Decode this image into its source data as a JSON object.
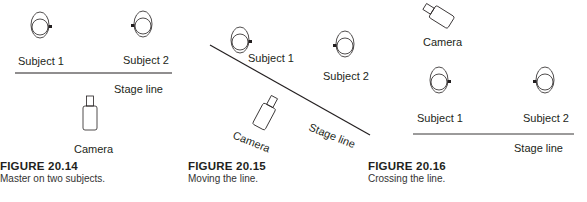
{
  "figures": [
    {
      "number": "FIGURE 20.14",
      "description": "Master on two subjects.",
      "labels": {
        "subject1": "Subject 1",
        "subject2": "Subject 2",
        "stage_line": "Stage line",
        "camera": "Camera"
      }
    },
    {
      "number": "FIGURE 20.15",
      "description": "Moving the line.",
      "labels": {
        "subject1": "Subject 1",
        "subject2": "Subject 2",
        "stage_line": "Stage line",
        "camera": "Camera"
      }
    },
    {
      "number": "FIGURE 20.16",
      "description": "Crossing the line.",
      "labels": {
        "subject1": "Subject 1",
        "subject2": "Subject 2",
        "stage_line": "Stage line",
        "camera": "Camera"
      }
    }
  ],
  "icons": {
    "subject": "subject-head-icon",
    "camera": "camera-icon"
  },
  "colors": {
    "ink": "#231f20",
    "background": "#ffffff"
  }
}
